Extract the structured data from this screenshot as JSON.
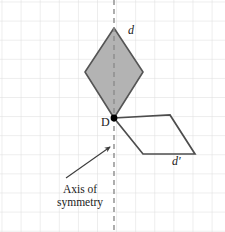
{
  "figure": {
    "canvas": {
      "width": 225,
      "height": 232,
      "background": "#ffffff"
    },
    "grid": {
      "visible": true,
      "spacing_px": 19.1,
      "color": "#dcdcdc",
      "origin_offset_x": 1.5,
      "origin_offset_y": 1.5
    },
    "colors": {
      "shape_fill": "#b3b3b3",
      "shape_stroke": "#555555",
      "image_stroke": "#4d4d4d",
      "axis_dash": "#8c8c8c",
      "grid": "#dcdcdc",
      "point": "#000000",
      "text": "#1a1a1a",
      "arrow": "#3c3c3c"
    }
  },
  "labels": {
    "preimage": "d",
    "image": "d′",
    "point_D": "D",
    "axis_caption_line1": "Axis of",
    "axis_caption_line2": "symmetry",
    "axis_caption_full": "Axis of symmetry"
  },
  "geometry": {
    "axis_of_symmetry": {
      "name": "vertical-dashed-axis",
      "x": 114,
      "y_start": 0,
      "y_end": 232,
      "dash_pattern": "5,4",
      "stroke_width": 1.4
    },
    "kite_preimage": {
      "name": "shaded-kite",
      "filled": true,
      "vertices": [
        {
          "x": 114,
          "y": 28
        },
        {
          "x": 143,
          "y": 72
        },
        {
          "x": 114,
          "y": 118
        },
        {
          "x": 85,
          "y": 72
        }
      ]
    },
    "parallelogram_image": {
      "name": "outlined-parallelogram",
      "filled": false,
      "vertices": [
        {
          "x": 114,
          "y": 118
        },
        {
          "x": 170,
          "y": 115
        },
        {
          "x": 195,
          "y": 154
        },
        {
          "x": 143,
          "y": 154
        }
      ]
    },
    "marked_point": {
      "name": "point-D",
      "x": 114,
      "y": 118,
      "radius": 3.4
    },
    "caption_arrow": {
      "name": "axis-callout-arrow",
      "tail": {
        "x": 66,
        "y": 178
      },
      "head": {
        "x": 110,
        "y": 147
      },
      "head_size": 6
    }
  }
}
